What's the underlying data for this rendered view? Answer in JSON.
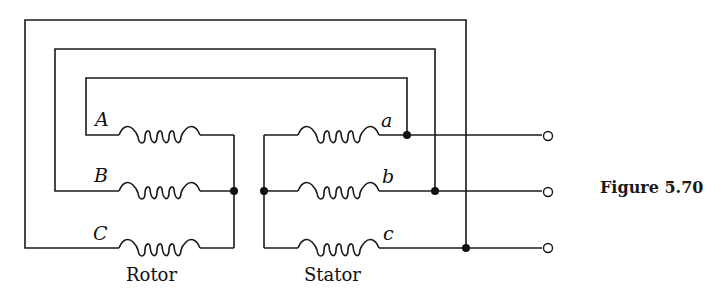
{
  "figure": {
    "caption": "Figure 5.70",
    "rotor_label": "Rotor",
    "stator_label": "Stator",
    "rotor_windings": [
      {
        "label": "A"
      },
      {
        "label": "B"
      },
      {
        "label": "C"
      }
    ],
    "stator_windings": [
      {
        "label": "a"
      },
      {
        "label": "b"
      },
      {
        "label": "c"
      }
    ],
    "terminals": 3
  }
}
